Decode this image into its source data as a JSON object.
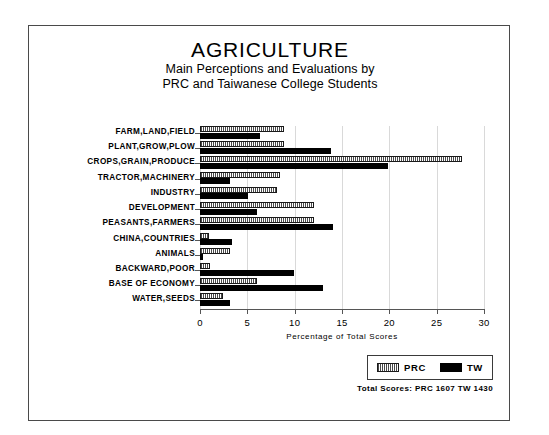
{
  "chart_data": {
    "type": "bar",
    "orientation": "horizontal",
    "title": "AGRICULTURE",
    "subtitle_lines": [
      "Main Perceptions and Evaluations by",
      "PRC and Taiwanese College Students"
    ],
    "xlabel": "Percentage of Total Scores",
    "ylabel": "",
    "xlim": [
      0,
      30
    ],
    "xticks": [
      0,
      5,
      10,
      15,
      20,
      25,
      30
    ],
    "xtick_labels": [
      "0",
      "5",
      "10",
      "15",
      "20",
      "25",
      "30"
    ],
    "grid": true,
    "grid_axis": "x",
    "legend_position": "bottom-right",
    "categories": [
      "FARM,LAND,FIELD",
      "PLANT,GROW,PLOW",
      "CROPS,GRAIN,PRODUCE",
      "TRACTOR,MACHINERY",
      "INDUSTRY",
      "DEVELOPMENT",
      "PEASANTS,FARMERS",
      "CHINA,COUNTRIES",
      "ANIMALS",
      "BACKWARD,POOR",
      "BASE OF ECONOMY",
      "WATER,SEEDS"
    ],
    "series": [
      {
        "name": "PRC",
        "style": "hatched",
        "color": "#b5b5b5",
        "values": [
          8.9,
          8.9,
          27.7,
          8.4,
          8.1,
          12.0,
          12.0,
          0.9,
          3.2,
          1.1,
          6.0,
          2.4
        ]
      },
      {
        "name": "TW",
        "style": "solid",
        "color": "#000000",
        "values": [
          6.3,
          13.8,
          19.9,
          3.2,
          5.1,
          6.0,
          14.1,
          3.4,
          0.3,
          9.9,
          13.0,
          3.2
        ]
      }
    ],
    "annotations": {
      "totals_label": "Total Scores:",
      "totals": [
        {
          "series": "PRC",
          "value": "1607"
        },
        {
          "series": "TW",
          "value": "1430"
        }
      ],
      "totals_text": "Total Scores:   PRC 1607   TW 1430"
    }
  },
  "legend": {
    "items": [
      {
        "label": "PRC",
        "swatch": "hatched-swatch"
      },
      {
        "label": "TW",
        "swatch": "solid-black-swatch"
      }
    ]
  }
}
